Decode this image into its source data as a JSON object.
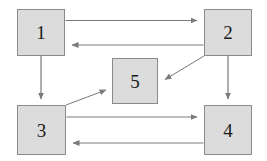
{
  "diagram": {
    "type": "block-diagram",
    "title": "",
    "background_color": "#ffffff",
    "node_fill_color": "#dcdcdc",
    "node_border_color": "#8a8a8a",
    "edge_color": "#7a7a7a",
    "label_color": "#1b1b1b",
    "nodes": [
      {
        "id": "1",
        "label": "1",
        "x": 17,
        "y": 9,
        "width": 48,
        "height": 47
      },
      {
        "id": "2",
        "label": "2",
        "x": 204,
        "y": 9,
        "width": 48,
        "height": 47
      },
      {
        "id": "5",
        "label": "5",
        "x": 112,
        "y": 58,
        "width": 46,
        "height": 46
      },
      {
        "id": "3",
        "label": "3",
        "x": 17,
        "y": 105,
        "width": 49,
        "height": 50
      },
      {
        "id": "4",
        "label": "4",
        "x": 204,
        "y": 105,
        "width": 48,
        "height": 50
      }
    ],
    "edges": [
      {
        "from": "1",
        "to": "2",
        "direction": "right",
        "label": ""
      },
      {
        "from": "2",
        "to": "1",
        "direction": "left",
        "label": ""
      },
      {
        "from": "1",
        "to": "3",
        "direction": "down",
        "label": ""
      },
      {
        "from": "2",
        "to": "4",
        "direction": "down",
        "label": ""
      },
      {
        "from": "2",
        "to": "5",
        "direction": "down-left",
        "label": ""
      },
      {
        "from": "3",
        "to": "5",
        "direction": "up-right",
        "label": ""
      },
      {
        "from": "3",
        "to": "4",
        "direction": "right",
        "label": ""
      },
      {
        "from": "4",
        "to": "3",
        "direction": "left",
        "label": ""
      }
    ]
  }
}
